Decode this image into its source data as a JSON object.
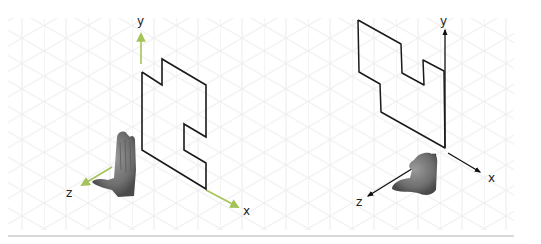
{
  "figure": {
    "panels": [
      {
        "id": "left",
        "description": "Clean isometric drawing of L-shaped outline with left-hand coordinate axes",
        "axis_color": "#a4c45a",
        "shape_color": "#1a1a1a",
        "axes": {
          "x_label": "x",
          "y_label": "y",
          "z_label": "z"
        },
        "hand": "left hand, thumb pointing along z"
      },
      {
        "id": "right",
        "description": "Hand-sketched isometric drawing of stepped outline with right-hand coordinate axes",
        "axis_color": "#111111",
        "shape_color": "#1a1a1a",
        "axes": {
          "x_label": "x",
          "y_label": "y",
          "z_label": "z"
        },
        "hand": "right hand, thumb pointing along z"
      }
    ],
    "grid": {
      "type": "isometric",
      "color": "#ececec",
      "spacing_px": 22
    },
    "divider_color": "#d9d9d9"
  }
}
